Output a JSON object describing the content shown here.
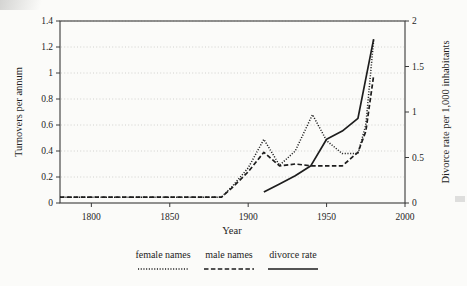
{
  "chart_data": {
    "type": "line",
    "title": "",
    "xlabel": "Year",
    "ylabel": "Turnovers per annum",
    "y2label": "Divorce rate per 1,000 inhabitants",
    "xlim": [
      1780,
      2000
    ],
    "ylim": [
      0,
      1.4
    ],
    "y2lim": [
      0,
      2
    ],
    "xticks": [
      1800,
      1850,
      1900,
      1950,
      2000
    ],
    "xtick_labels": [
      "1800",
      "1850",
      "1900",
      "1950",
      "2000"
    ],
    "yticks": [
      0,
      0.2,
      0.4,
      0.6,
      0.8,
      1,
      1.2,
      1.4
    ],
    "ytick_labels": [
      "0",
      "0.2",
      "0.4",
      "0.6",
      "0.8",
      "1",
      "1.2",
      "1.4"
    ],
    "y2ticks": [
      0,
      0.5,
      1,
      1.5,
      2
    ],
    "y2tick_labels": [
      "0",
      "0.5",
      "1",
      "1.5",
      "2"
    ],
    "grid": true,
    "grid_style": "dotted-horizontal",
    "legend_position": "below",
    "series": [
      {
        "name": "female names",
        "axis": "left",
        "style": "dotted",
        "color": "#1d1d1d",
        "points": [
          [
            1780,
            0.045
          ],
          [
            1800,
            0.045
          ],
          [
            1820,
            0.045
          ],
          [
            1840,
            0.045
          ],
          [
            1860,
            0.045
          ],
          [
            1875,
            0.045
          ],
          [
            1883,
            0.045
          ],
          [
            1890,
            0.13
          ],
          [
            1900,
            0.27
          ],
          [
            1910,
            0.49
          ],
          [
            1920,
            0.29
          ],
          [
            1930,
            0.4
          ],
          [
            1941,
            0.68
          ],
          [
            1950,
            0.48
          ],
          [
            1960,
            0.38
          ],
          [
            1970,
            0.38
          ],
          [
            1975,
            0.6
          ],
          [
            1980,
            1.25
          ]
        ]
      },
      {
        "name": "male names",
        "axis": "left",
        "style": "dashed",
        "color": "#1d1d1d",
        "points": [
          [
            1780,
            0.045
          ],
          [
            1800,
            0.045
          ],
          [
            1820,
            0.045
          ],
          [
            1840,
            0.045
          ],
          [
            1860,
            0.045
          ],
          [
            1875,
            0.045
          ],
          [
            1883,
            0.045
          ],
          [
            1890,
            0.12
          ],
          [
            1900,
            0.24
          ],
          [
            1910,
            0.39
          ],
          [
            1920,
            0.285
          ],
          [
            1930,
            0.3
          ],
          [
            1941,
            0.285
          ],
          [
            1950,
            0.285
          ],
          [
            1960,
            0.285
          ],
          [
            1970,
            0.39
          ],
          [
            1975,
            0.55
          ],
          [
            1980,
            0.98
          ]
        ]
      },
      {
        "name": "divorce rate",
        "axis": "right",
        "style": "solid",
        "color": "#1d1d1d",
        "points": [
          [
            1910,
            0.12
          ],
          [
            1920,
            0.21
          ],
          [
            1930,
            0.3
          ],
          [
            1940,
            0.41
          ],
          [
            1950,
            0.7
          ],
          [
            1960,
            0.79
          ],
          [
            1970,
            0.93
          ],
          [
            1980,
            1.8
          ]
        ]
      }
    ],
    "legend": [
      {
        "label": "female names",
        "style": "dotted"
      },
      {
        "label": "male names",
        "style": "dashed"
      },
      {
        "label": "divorce rate",
        "style": "solid"
      }
    ]
  }
}
